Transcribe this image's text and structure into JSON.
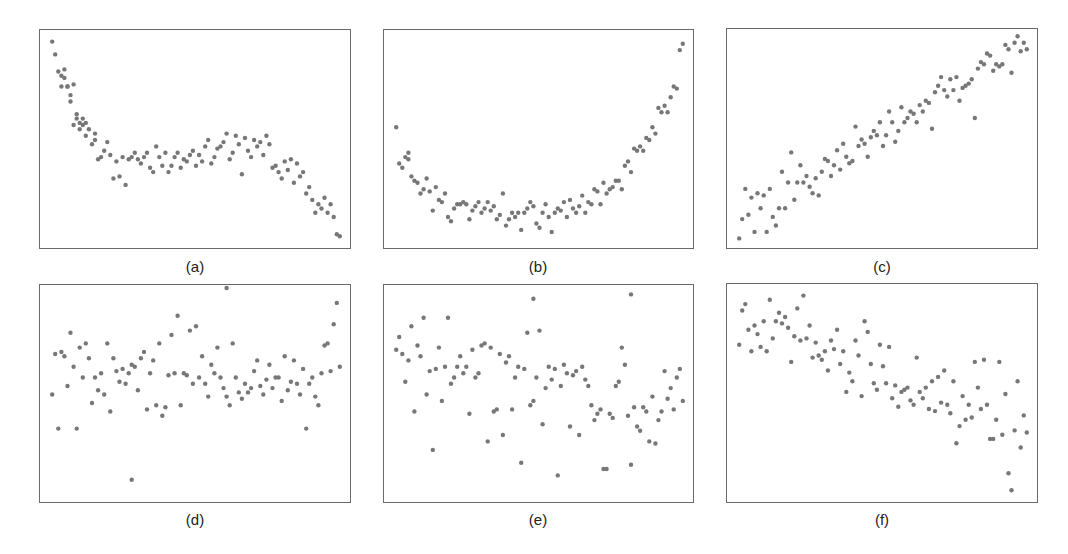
{
  "chart_data": [
    {
      "type": "scatter",
      "title": "(a)",
      "xlabel": "",
      "ylabel": "",
      "grid": false,
      "xlim": [
        0,
        1
      ],
      "ylim": [
        0,
        1
      ],
      "description": "Cubic-like decreasing trend: steep drop, plateau, then drop",
      "x": [
        0.03,
        0.04,
        0.05,
        0.06,
        0.06,
        0.07,
        0.07,
        0.08,
        0.08,
        0.09,
        0.09,
        0.1,
        0.1,
        0.11,
        0.11,
        0.12,
        0.12,
        0.13,
        0.13,
        0.14,
        0.14,
        0.15,
        0.16,
        0.17,
        0.17,
        0.18,
        0.19,
        0.2,
        0.21,
        0.22,
        0.23,
        0.24,
        0.25,
        0.26,
        0.27,
        0.28,
        0.29,
        0.3,
        0.31,
        0.32,
        0.33,
        0.34,
        0.35,
        0.36,
        0.37,
        0.38,
        0.39,
        0.4,
        0.41,
        0.42,
        0.43,
        0.44,
        0.45,
        0.46,
        0.47,
        0.48,
        0.49,
        0.5,
        0.51,
        0.52,
        0.53,
        0.54,
        0.55,
        0.56,
        0.57,
        0.58,
        0.59,
        0.6,
        0.61,
        0.62,
        0.63,
        0.64,
        0.65,
        0.66,
        0.67,
        0.68,
        0.69,
        0.7,
        0.71,
        0.72,
        0.73,
        0.74,
        0.75,
        0.76,
        0.77,
        0.78,
        0.79,
        0.8,
        0.81,
        0.82,
        0.83,
        0.84,
        0.85,
        0.86,
        0.87,
        0.88,
        0.89,
        0.9,
        0.91,
        0.92,
        0.93,
        0.94,
        0.95,
        0.96,
        0.97
      ],
      "y": [
        0.96,
        0.9,
        0.82,
        0.75,
        0.8,
        0.79,
        0.83,
        0.75,
        0.75,
        0.68,
        0.71,
        0.76,
        0.57,
        0.6,
        0.62,
        0.58,
        0.55,
        0.57,
        0.6,
        0.52,
        0.58,
        0.55,
        0.48,
        0.5,
        0.53,
        0.41,
        0.42,
        0.45,
        0.49,
        0.43,
        0.32,
        0.4,
        0.33,
        0.42,
        0.29,
        0.41,
        0.42,
        0.44,
        0.41,
        0.39,
        0.42,
        0.44,
        0.37,
        0.35,
        0.47,
        0.42,
        0.38,
        0.44,
        0.35,
        0.38,
        0.42,
        0.44,
        0.37,
        0.41,
        0.4,
        0.43,
        0.45,
        0.38,
        0.43,
        0.4,
        0.47,
        0.5,
        0.39,
        0.42,
        0.46,
        0.47,
        0.49,
        0.53,
        0.41,
        0.44,
        0.52,
        0.48,
        0.34,
        0.51,
        0.45,
        0.42,
        0.5,
        0.47,
        0.49,
        0.43,
        0.52,
        0.48,
        0.37,
        0.38,
        0.35,
        0.32,
        0.4,
        0.36,
        0.41,
        0.3,
        0.39,
        0.33,
        0.35,
        0.25,
        0.28,
        0.22,
        0.16,
        0.2,
        0.18,
        0.23,
        0.16,
        0.2,
        0.14,
        0.06,
        0.05
      ]
    },
    {
      "type": "scatter",
      "title": "(b)",
      "xlabel": "",
      "ylabel": "",
      "grid": false,
      "xlim": [
        0,
        1
      ],
      "ylim": [
        0,
        1
      ],
      "description": "U-shaped quadratic relationship",
      "x": [
        0.03,
        0.04,
        0.05,
        0.06,
        0.07,
        0.07,
        0.08,
        0.09,
        0.1,
        0.11,
        0.12,
        0.13,
        0.14,
        0.15,
        0.16,
        0.17,
        0.18,
        0.19,
        0.2,
        0.21,
        0.22,
        0.23,
        0.24,
        0.25,
        0.26,
        0.27,
        0.28,
        0.29,
        0.3,
        0.31,
        0.32,
        0.33,
        0.34,
        0.35,
        0.36,
        0.37,
        0.38,
        0.39,
        0.4,
        0.41,
        0.42,
        0.43,
        0.44,
        0.45,
        0.46,
        0.47,
        0.48,
        0.49,
        0.5,
        0.51,
        0.52,
        0.53,
        0.54,
        0.55,
        0.56,
        0.57,
        0.58,
        0.59,
        0.6,
        0.61,
        0.62,
        0.63,
        0.64,
        0.65,
        0.66,
        0.67,
        0.68,
        0.69,
        0.7,
        0.71,
        0.72,
        0.73,
        0.74,
        0.75,
        0.76,
        0.77,
        0.78,
        0.79,
        0.8,
        0.81,
        0.82,
        0.83,
        0.84,
        0.85,
        0.86,
        0.87,
        0.88,
        0.89,
        0.9,
        0.91,
        0.92,
        0.93,
        0.94,
        0.95,
        0.96,
        0.97
      ],
      "y": [
        0.56,
        0.39,
        0.37,
        0.42,
        0.41,
        0.44,
        0.33,
        0.31,
        0.3,
        0.25,
        0.27,
        0.32,
        0.26,
        0.17,
        0.28,
        0.22,
        0.21,
        0.25,
        0.14,
        0.12,
        0.18,
        0.2,
        0.2,
        0.21,
        0.2,
        0.13,
        0.17,
        0.19,
        0.21,
        0.16,
        0.18,
        0.21,
        0.17,
        0.19,
        0.13,
        0.15,
        0.25,
        0.1,
        0.13,
        0.16,
        0.14,
        0.16,
        0.08,
        0.16,
        0.18,
        0.21,
        0.19,
        0.11,
        0.09,
        0.16,
        0.2,
        0.14,
        0.07,
        0.16,
        0.18,
        0.17,
        0.21,
        0.14,
        0.22,
        0.18,
        0.16,
        0.19,
        0.24,
        0.16,
        0.21,
        0.2,
        0.27,
        0.26,
        0.2,
        0.3,
        0.25,
        0.27,
        0.28,
        0.31,
        0.31,
        0.27,
        0.38,
        0.4,
        0.35,
        0.46,
        0.45,
        0.47,
        0.45,
        0.51,
        0.5,
        0.56,
        0.53,
        0.65,
        0.63,
        0.66,
        0.63,
        0.7,
        0.75,
        0.74,
        0.92,
        0.95
      ]
    },
    {
      "type": "scatter",
      "title": "(c)",
      "xlabel": "",
      "ylabel": "",
      "grid": false,
      "xlim": [
        0,
        1
      ],
      "ylim": [
        0,
        1
      ],
      "description": "Strong positive linear relationship",
      "x": [
        0.03,
        0.04,
        0.05,
        0.06,
        0.07,
        0.08,
        0.09,
        0.1,
        0.11,
        0.12,
        0.13,
        0.14,
        0.15,
        0.16,
        0.17,
        0.18,
        0.19,
        0.2,
        0.21,
        0.22,
        0.23,
        0.24,
        0.25,
        0.26,
        0.27,
        0.28,
        0.29,
        0.3,
        0.31,
        0.32,
        0.33,
        0.34,
        0.35,
        0.36,
        0.37,
        0.38,
        0.39,
        0.4,
        0.41,
        0.42,
        0.43,
        0.44,
        0.45,
        0.46,
        0.47,
        0.48,
        0.49,
        0.5,
        0.51,
        0.52,
        0.53,
        0.54,
        0.55,
        0.56,
        0.57,
        0.58,
        0.59,
        0.6,
        0.61,
        0.62,
        0.63,
        0.64,
        0.65,
        0.66,
        0.67,
        0.68,
        0.69,
        0.7,
        0.71,
        0.72,
        0.73,
        0.74,
        0.75,
        0.76,
        0.77,
        0.78,
        0.79,
        0.8,
        0.81,
        0.82,
        0.83,
        0.84,
        0.85,
        0.86,
        0.87,
        0.88,
        0.89,
        0.9,
        0.91,
        0.92,
        0.93,
        0.94,
        0.95,
        0.96,
        0.97
      ],
      "y": [
        0.04,
        0.13,
        0.27,
        0.15,
        0.23,
        0.07,
        0.25,
        0.18,
        0.24,
        0.07,
        0.27,
        0.14,
        0.1,
        0.18,
        0.35,
        0.18,
        0.3,
        0.44,
        0.22,
        0.3,
        0.38,
        0.3,
        0.33,
        0.28,
        0.25,
        0.32,
        0.24,
        0.35,
        0.41,
        0.4,
        0.33,
        0.38,
        0.45,
        0.36,
        0.48,
        0.42,
        0.39,
        0.4,
        0.56,
        0.47,
        0.5,
        0.48,
        0.42,
        0.51,
        0.54,
        0.52,
        0.58,
        0.47,
        0.52,
        0.63,
        0.58,
        0.49,
        0.54,
        0.65,
        0.58,
        0.6,
        0.63,
        0.62,
        0.58,
        0.66,
        0.63,
        0.68,
        0.67,
        0.55,
        0.72,
        0.75,
        0.79,
        0.73,
        0.7,
        0.78,
        0.73,
        0.79,
        0.68,
        0.74,
        0.75,
        0.76,
        0.78,
        0.6,
        0.83,
        0.86,
        0.85,
        0.9,
        0.89,
        0.82,
        0.85,
        0.84,
        0.85,
        0.94,
        0.92,
        0.81,
        0.95,
        0.98,
        0.91,
        0.95,
        0.92
      ]
    },
    {
      "type": "scatter",
      "title": "(d)",
      "xlabel": "",
      "ylabel": "",
      "grid": false,
      "xlim": [
        0,
        1
      ],
      "ylim": [
        0,
        1
      ],
      "description": "No apparent relationship (random scatter around a horizontal band)",
      "x": [
        0.03,
        0.04,
        0.05,
        0.06,
        0.07,
        0.08,
        0.09,
        0.1,
        0.11,
        0.12,
        0.13,
        0.14,
        0.15,
        0.16,
        0.17,
        0.18,
        0.19,
        0.2,
        0.21,
        0.22,
        0.23,
        0.24,
        0.25,
        0.26,
        0.27,
        0.28,
        0.29,
        0.3,
        0.31,
        0.32,
        0.33,
        0.34,
        0.35,
        0.36,
        0.37,
        0.38,
        0.39,
        0.4,
        0.41,
        0.42,
        0.43,
        0.44,
        0.45,
        0.46,
        0.47,
        0.48,
        0.49,
        0.5,
        0.51,
        0.52,
        0.53,
        0.54,
        0.55,
        0.56,
        0.57,
        0.58,
        0.59,
        0.6,
        0.61,
        0.62,
        0.63,
        0.64,
        0.65,
        0.66,
        0.67,
        0.68,
        0.69,
        0.7,
        0.71,
        0.72,
        0.73,
        0.74,
        0.75,
        0.76,
        0.77,
        0.78,
        0.79,
        0.8,
        0.81,
        0.82,
        0.83,
        0.84,
        0.85,
        0.86,
        0.87,
        0.88,
        0.89,
        0.9,
        0.91,
        0.92,
        0.93,
        0.94,
        0.95,
        0.96,
        0.97,
        0.29,
        0.6
      ],
      "y": [
        0.5,
        0.69,
        0.34,
        0.7,
        0.68,
        0.54,
        0.79,
        0.63,
        0.34,
        0.72,
        0.58,
        0.74,
        0.67,
        0.46,
        0.58,
        0.52,
        0.6,
        0.5,
        0.74,
        0.42,
        0.67,
        0.61,
        0.56,
        0.62,
        0.55,
        0.6,
        0.64,
        0.63,
        0.52,
        0.67,
        0.7,
        0.43,
        0.6,
        0.66,
        0.45,
        0.74,
        0.4,
        0.44,
        0.59,
        0.78,
        0.6,
        0.87,
        0.45,
        0.6,
        0.59,
        0.8,
        0.55,
        0.82,
        0.58,
        0.68,
        0.55,
        0.49,
        0.64,
        0.6,
        0.72,
        0.58,
        0.53,
        0.49,
        0.45,
        0.74,
        0.58,
        0.51,
        0.48,
        0.55,
        0.51,
        0.53,
        0.61,
        0.66,
        0.54,
        0.5,
        0.57,
        0.64,
        0.53,
        0.58,
        0.58,
        0.47,
        0.68,
        0.52,
        0.56,
        0.66,
        0.55,
        0.5,
        0.62,
        0.34,
        0.55,
        0.58,
        0.49,
        0.45,
        0.6,
        0.73,
        0.74,
        0.61,
        0.83,
        0.93,
        0.63,
        0.1,
        1.0
      ],
      "notes": "Outliers near bottom (x≈0.29, y≈0.10) and top edge (x≈0.6, y≈1.0)"
    },
    {
      "type": "scatter",
      "title": "(e)",
      "xlabel": "",
      "ylabel": "",
      "grid": false,
      "xlim": [
        0,
        1
      ],
      "ylim": [
        0,
        1
      ],
      "description": "Weak negative relationship with high scatter",
      "x": [
        0.03,
        0.04,
        0.05,
        0.06,
        0.07,
        0.08,
        0.09,
        0.1,
        0.11,
        0.12,
        0.13,
        0.14,
        0.15,
        0.16,
        0.17,
        0.18,
        0.19,
        0.2,
        0.21,
        0.22,
        0.23,
        0.24,
        0.25,
        0.26,
        0.27,
        0.28,
        0.29,
        0.3,
        0.31,
        0.32,
        0.33,
        0.34,
        0.35,
        0.36,
        0.37,
        0.38,
        0.39,
        0.4,
        0.41,
        0.42,
        0.43,
        0.44,
        0.45,
        0.46,
        0.47,
        0.48,
        0.49,
        0.5,
        0.51,
        0.52,
        0.53,
        0.54,
        0.55,
        0.56,
        0.57,
        0.58,
        0.59,
        0.6,
        0.61,
        0.62,
        0.63,
        0.64,
        0.65,
        0.66,
        0.67,
        0.68,
        0.69,
        0.7,
        0.71,
        0.72,
        0.73,
        0.74,
        0.75,
        0.76,
        0.77,
        0.78,
        0.79,
        0.8,
        0.81,
        0.82,
        0.83,
        0.84,
        0.85,
        0.86,
        0.87,
        0.88,
        0.89,
        0.9,
        0.91,
        0.92,
        0.93,
        0.94,
        0.95,
        0.96,
        0.97,
        0.48,
        0.8
      ],
      "y": [
        0.71,
        0.77,
        0.69,
        0.56,
        0.66,
        0.82,
        0.42,
        0.73,
        0.68,
        0.86,
        0.5,
        0.61,
        0.24,
        0.62,
        0.72,
        0.47,
        0.63,
        0.86,
        0.55,
        0.58,
        0.63,
        0.68,
        0.6,
        0.63,
        0.41,
        0.71,
        0.58,
        0.6,
        0.73,
        0.74,
        0.28,
        0.72,
        0.42,
        0.43,
        0.69,
        0.31,
        0.65,
        0.68,
        0.43,
        0.58,
        0.63,
        0.18,
        0.62,
        0.79,
        0.45,
        0.47,
        0.58,
        0.8,
        0.36,
        0.53,
        0.63,
        0.57,
        0.62,
        0.12,
        0.54,
        0.64,
        0.6,
        0.35,
        0.59,
        0.61,
        0.31,
        0.63,
        0.57,
        0.54,
        0.45,
        0.38,
        0.41,
        0.43,
        0.15,
        0.15,
        0.41,
        0.39,
        0.54,
        0.56,
        0.72,
        0.64,
        0.4,
        0.17,
        0.44,
        0.35,
        0.33,
        0.44,
        0.42,
        0.28,
        0.49,
        0.27,
        0.38,
        0.42,
        0.61,
        0.48,
        0.53,
        0.43,
        0.58,
        0.62,
        0.47,
        0.95,
        0.97
      ],
      "notes": "Outliers at top (x≈0.48 and x≈0.8)"
    },
    {
      "type": "scatter",
      "title": "(f)",
      "xlabel": "",
      "ylabel": "",
      "grid": false,
      "xlim": [
        0,
        1
      ],
      "ylim": [
        0,
        1
      ],
      "description": "Moderate negative linear relationship",
      "x": [
        0.03,
        0.04,
        0.05,
        0.06,
        0.07,
        0.08,
        0.09,
        0.1,
        0.11,
        0.12,
        0.13,
        0.14,
        0.15,
        0.16,
        0.17,
        0.18,
        0.19,
        0.2,
        0.21,
        0.22,
        0.23,
        0.24,
        0.25,
        0.26,
        0.27,
        0.28,
        0.29,
        0.3,
        0.31,
        0.32,
        0.33,
        0.34,
        0.35,
        0.36,
        0.37,
        0.38,
        0.39,
        0.4,
        0.41,
        0.42,
        0.43,
        0.44,
        0.45,
        0.46,
        0.47,
        0.48,
        0.49,
        0.5,
        0.51,
        0.52,
        0.53,
        0.54,
        0.55,
        0.56,
        0.57,
        0.58,
        0.59,
        0.6,
        0.61,
        0.62,
        0.63,
        0.64,
        0.65,
        0.66,
        0.67,
        0.68,
        0.69,
        0.7,
        0.71,
        0.72,
        0.73,
        0.74,
        0.75,
        0.76,
        0.77,
        0.78,
        0.79,
        0.8,
        0.81,
        0.82,
        0.83,
        0.84,
        0.85,
        0.86,
        0.87,
        0.88,
        0.89,
        0.9,
        0.91,
        0.92,
        0.93,
        0.94,
        0.95,
        0.96,
        0.97
      ],
      "y": [
        0.73,
        0.89,
        0.92,
        0.8,
        0.7,
        0.82,
        0.78,
        0.72,
        0.84,
        0.7,
        0.94,
        0.76,
        0.84,
        0.88,
        0.83,
        0.86,
        0.81,
        0.65,
        0.77,
        0.9,
        0.75,
        0.96,
        0.76,
        0.82,
        0.67,
        0.74,
        0.68,
        0.66,
        0.7,
        0.61,
        0.75,
        0.71,
        0.8,
        0.64,
        0.7,
        0.51,
        0.6,
        0.56,
        0.75,
        0.68,
        0.49,
        0.84,
        0.79,
        0.64,
        0.55,
        0.52,
        0.73,
        0.63,
        0.55,
        0.72,
        0.48,
        0.54,
        0.44,
        0.51,
        0.52,
        0.53,
        0.47,
        0.45,
        0.67,
        0.51,
        0.48,
        0.53,
        0.43,
        0.56,
        0.42,
        0.58,
        0.46,
        0.61,
        0.45,
        0.41,
        0.56,
        0.27,
        0.35,
        0.49,
        0.38,
        0.45,
        0.39,
        0.65,
        0.53,
        0.43,
        0.66,
        0.45,
        0.29,
        0.29,
        0.38,
        0.65,
        0.31,
        0.5,
        0.13,
        0.05,
        0.33,
        0.56,
        0.25,
        0.4,
        0.32
      ],
      "notes": "Outliers at bottom right (x≈0.88, y≈0.13; x≈0.9, y≈0.05)"
    }
  ],
  "panels": [
    {
      "label": "(a)"
    },
    {
      "label": "(b)"
    },
    {
      "label": "(c)"
    },
    {
      "label": "(d)"
    },
    {
      "label": "(e)"
    },
    {
      "label": "(f)"
    }
  ],
  "style": {
    "point_color": "#777777",
    "frame_color": "#6a6a6a",
    "point_radius": 2.2
  }
}
